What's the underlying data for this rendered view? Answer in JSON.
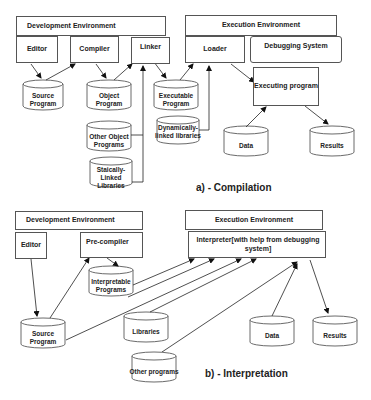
{
  "compilation": {
    "caption": "a) - Compilation",
    "dev_env": "Development Environment",
    "exec_env": "Execution Environment",
    "editor": "Editor",
    "compiler": "Compiler",
    "linker": "Linker",
    "loader": "Loader",
    "debugging_system": "Debugging System",
    "executing_program": "Executing program",
    "source_program": "Source Program",
    "object_program": "Object Program",
    "executable_program": "Executable Program",
    "other_object_programs": "Other Object Programs",
    "statically_linked_libraries": "Staically-Linked Libraries",
    "dynamically_linked_libraries": "Dynamically-linked libraries",
    "data": "Data",
    "results": "Results"
  },
  "interpretation": {
    "caption": "b) - Interpretation",
    "dev_env": "Development Environment",
    "exec_env": "Execution Environment",
    "editor": "Editor",
    "precompiler": "Pre-compiler",
    "interpreter": "Interpreter[with help from debugging system]",
    "interpretable_programs": "Interpretable Programs",
    "source_program": "Source Program",
    "libraries": "Libraries",
    "other_programs": "Other programs",
    "data": "Data",
    "results": "Results"
  }
}
